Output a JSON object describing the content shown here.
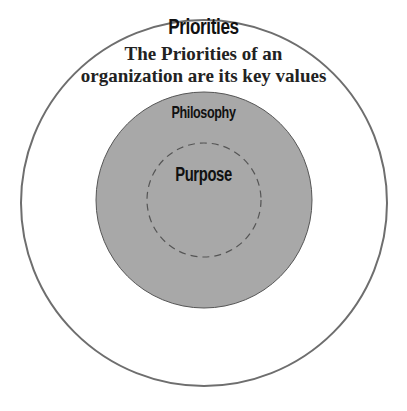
{
  "diagram": {
    "outer": {
      "title": "Priorities",
      "description_lines": [
        "The Priorities of an",
        "organization are its key values"
      ],
      "stroke": "#6e6e6e",
      "fill": "#ffffff"
    },
    "middle": {
      "title": "Philosophy",
      "fill": "#a8a8a8",
      "stroke": "#555555"
    },
    "inner": {
      "title": "Purpose",
      "stroke": "#555555",
      "style": "dashed"
    }
  }
}
